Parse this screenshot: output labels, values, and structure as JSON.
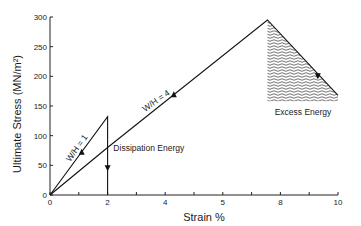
{
  "chart_data": {
    "type": "line",
    "title": "",
    "xlabel": "Strain %",
    "ylabel": "Ultimate Stress (MN/m²)",
    "xlim": [
      0,
      10
    ],
    "ylim": [
      0,
      300
    ],
    "x_ticks": [
      0,
      2,
      4,
      6,
      8,
      10
    ],
    "x_tick_labels": [
      "0",
      "2",
      "4",
      "5",
      "8",
      "10"
    ],
    "x_minor_ticks": [
      1,
      3,
      5,
      7,
      9
    ],
    "y_ticks": [
      0,
      50,
      100,
      150,
      200,
      250,
      300
    ],
    "y_tick_labels": [
      "0",
      "50",
      "100",
      "150",
      "200",
      "250",
      "300"
    ],
    "grid": false,
    "legend": null,
    "series": [
      {
        "name": "W/H = 1",
        "points": [
          [
            0,
            0
          ],
          [
            2,
            132
          ],
          [
            2,
            0
          ]
        ],
        "arrows": [
          {
            "x": 1.1,
            "y": 73,
            "direction": "up"
          },
          {
            "x": 2,
            "y": 45,
            "direction": "down"
          }
        ]
      },
      {
        "name": "W/H = 4",
        "points": [
          [
            0,
            0
          ],
          [
            2,
            80
          ],
          [
            7.55,
            295
          ],
          [
            10,
            168
          ]
        ],
        "arrows": [
          {
            "x": 4.3,
            "y": 170,
            "direction": "up"
          },
          {
            "x": 9.3,
            "y": 200,
            "direction": "down"
          }
        ]
      }
    ],
    "annotations": [
      {
        "text": "W/H = 1",
        "x": 0.7,
        "y": 55,
        "rotation": -55
      },
      {
        "text": "W/H = 4",
        "x": 3.3,
        "y": 140,
        "rotation": -35
      },
      {
        "text": "Dissipation Energy",
        "x": 2.2,
        "y": 75
      },
      {
        "text": "Excess Energy",
        "x": 7.8,
        "y": 135
      }
    ],
    "shaded_regions": [
      {
        "name": "Excess Energy",
        "polygon": [
          [
            7.55,
            295
          ],
          [
            10,
            168
          ],
          [
            10,
            158
          ],
          [
            7.55,
            158
          ]
        ],
        "pattern": "wavy-hatch"
      }
    ]
  }
}
